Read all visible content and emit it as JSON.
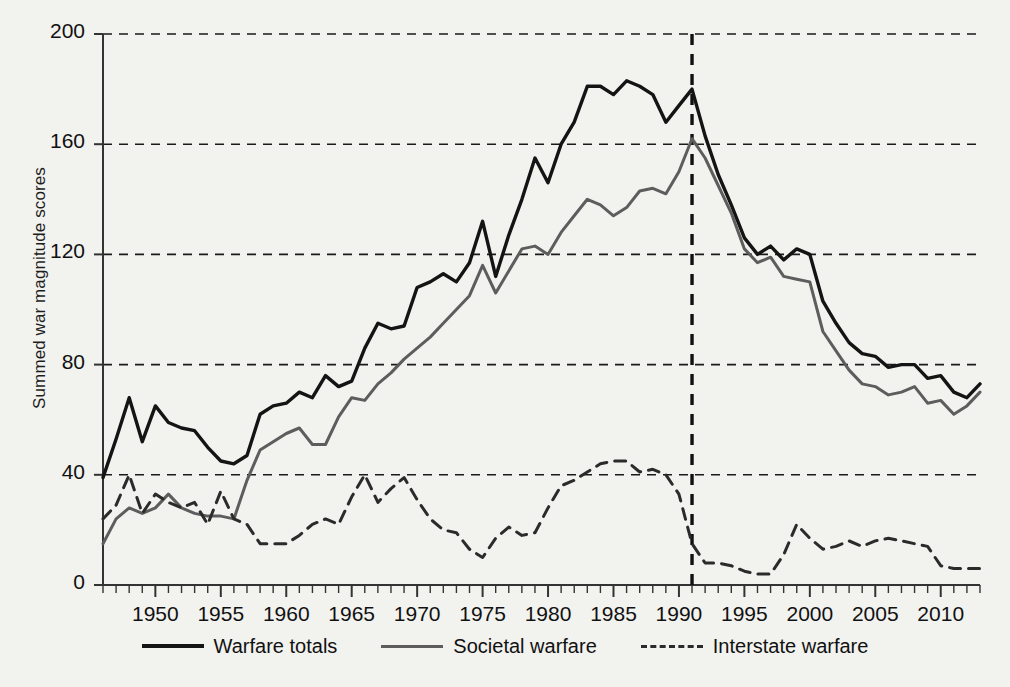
{
  "chart_data": {
    "type": "line",
    "title": "",
    "xlabel": "",
    "ylabel": "Summed war magnitude scores",
    "xlim": [
      1946,
      2013
    ],
    "ylim": [
      0,
      200
    ],
    "grid": "horizontal-dashed",
    "legend_position": "bottom",
    "ytick_labels": [
      "0",
      "40",
      "80",
      "120",
      "160",
      "200"
    ],
    "ytick_values": [
      0,
      40,
      80,
      120,
      160,
      200
    ],
    "xtick_labels": [
      "1950",
      "1955",
      "1960",
      "1965",
      "1970",
      "1975",
      "1980",
      "1985",
      "1990",
      "1995",
      "2000",
      "2005",
      "2010"
    ],
    "xtick_values": [
      1950,
      1955,
      1960,
      1965,
      1970,
      1975,
      1980,
      1985,
      1990,
      1995,
      2000,
      2005,
      2010
    ],
    "minor_tick_interval": 1,
    "annotations": [
      {
        "type": "vertical-line",
        "x": 1991,
        "style": "dashed",
        "color": "#111111"
      }
    ],
    "x": [
      1946,
      1947,
      1948,
      1949,
      1950,
      1951,
      1952,
      1953,
      1954,
      1955,
      1956,
      1957,
      1958,
      1959,
      1960,
      1961,
      1962,
      1963,
      1964,
      1965,
      1966,
      1967,
      1968,
      1969,
      1970,
      1971,
      1972,
      1973,
      1974,
      1975,
      1976,
      1977,
      1978,
      1979,
      1980,
      1981,
      1982,
      1983,
      1984,
      1985,
      1986,
      1987,
      1988,
      1989,
      1990,
      1991,
      1992,
      1993,
      1994,
      1995,
      1996,
      1997,
      1998,
      1999,
      2000,
      2001,
      2002,
      2003,
      2004,
      2005,
      2006,
      2007,
      2008,
      2009,
      2010,
      2011,
      2012,
      2013
    ],
    "series": [
      {
        "name": "Warfare totals",
        "style": "solid",
        "color": "#141414",
        "width": 3.4,
        "values": [
          39,
          53,
          68,
          52,
          65,
          59,
          57,
          56,
          50,
          45,
          44,
          47,
          62,
          65,
          66,
          70,
          68,
          76,
          72,
          74,
          86,
          95,
          93,
          94,
          108,
          110,
          113,
          110,
          117,
          132,
          112,
          127,
          140,
          155,
          146,
          160,
          168,
          181,
          181,
          178,
          183,
          181,
          178,
          168,
          174,
          180,
          163,
          149,
          138,
          126,
          120,
          123,
          118,
          122,
          120,
          103,
          95,
          88,
          84,
          83,
          79,
          80,
          80,
          75,
          76,
          70,
          68,
          73
        ]
      },
      {
        "name": "Societal warfare",
        "style": "solid",
        "color": "#5d5d5d",
        "width": 3.0,
        "values": [
          15,
          24,
          28,
          26,
          28,
          33,
          28,
          26,
          25,
          25,
          24,
          38,
          49,
          52,
          55,
          57,
          51,
          51,
          61,
          68,
          67,
          73,
          77,
          82,
          86,
          90,
          95,
          100,
          105,
          116,
          106,
          114,
          122,
          123,
          120,
          128,
          134,
          140,
          138,
          134,
          137,
          143,
          144,
          142,
          150,
          162,
          155,
          145,
          135,
          122,
          117,
          119,
          112,
          111,
          110,
          92,
          85,
          78,
          73,
          72,
          69,
          70,
          72,
          66,
          67,
          62,
          65,
          70
        ]
      },
      {
        "name": "Interstate warfare",
        "style": "dashed",
        "color": "#2b2b2b",
        "width": 3.0,
        "values": [
          24,
          29,
          40,
          26,
          33,
          30,
          28,
          30,
          22,
          34,
          24,
          22,
          15,
          15,
          15,
          18,
          22,
          24,
          22,
          32,
          40,
          30,
          35,
          39,
          31,
          24,
          20,
          19,
          13,
          10,
          17,
          21,
          18,
          19,
          28,
          36,
          38,
          41,
          44,
          45,
          45,
          41,
          42,
          40,
          33,
          15,
          8,
          8,
          7,
          5,
          4,
          4,
          11,
          22,
          17,
          13,
          14,
          16,
          14,
          16,
          17,
          16,
          15,
          14,
          7,
          6,
          6,
          6
        ]
      }
    ]
  },
  "legend": {
    "items": [
      {
        "label": "Warfare totals"
      },
      {
        "label": "Societal warfare"
      },
      {
        "label": "Interstate warfare"
      }
    ]
  }
}
